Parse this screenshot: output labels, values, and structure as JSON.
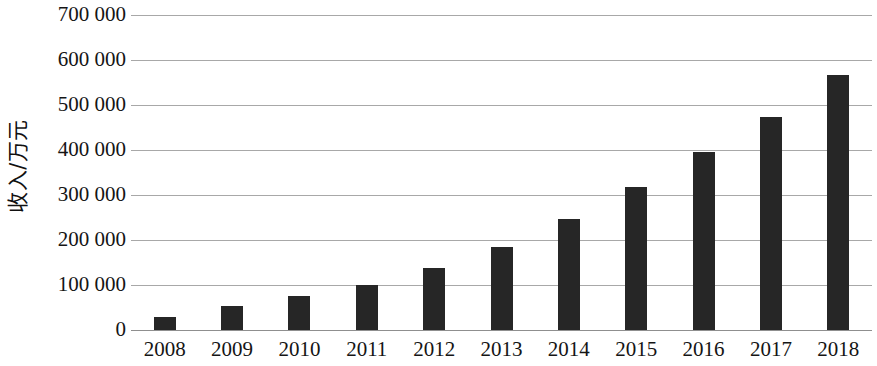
{
  "chart_data": {
    "type": "bar",
    "title": "",
    "subtitle": "",
    "xlabel": "",
    "ylabel": "收入/万元",
    "categories": [
      "2008",
      "2009",
      "2010",
      "2011",
      "2012",
      "2013",
      "2014",
      "2015",
      "2016",
      "2017",
      "2018"
    ],
    "values": [
      29000,
      53000,
      76000,
      99000,
      138000,
      185000,
      247000,
      318000,
      396000,
      473000,
      567000
    ],
    "ylim": [
      0,
      700000
    ],
    "ytick_values": [
      0,
      100000,
      200000,
      300000,
      400000,
      500000,
      600000,
      700000
    ],
    "ytick_labels": [
      "0",
      "100 000",
      "200 000",
      "300 000",
      "400 000",
      "500 000",
      "600 000",
      "700 000"
    ],
    "grid": true,
    "grid_axis": "y",
    "legend": false,
    "legend_position": "none",
    "bar_color": "#262626",
    "gridline_color": "#a8a8a8",
    "axis_color": "#8f8f8f",
    "background_color": "#ffffff",
    "series": [
      {
        "name": "收入",
        "values": [
          29000,
          53000,
          76000,
          99000,
          138000,
          185000,
          247000,
          318000,
          396000,
          473000,
          567000
        ]
      }
    ]
  }
}
